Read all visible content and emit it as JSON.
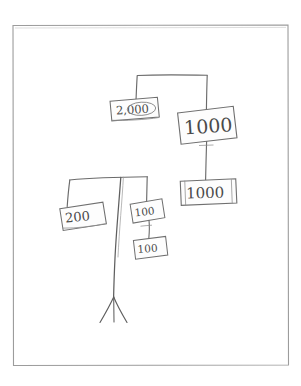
{
  "image": {
    "kind": "scanned-hand-drawn-diagram",
    "title": "Hand-drawn banknote denomination tree",
    "background_color": "#ffffff",
    "ink_color": "#5a5a5a",
    "frame": {
      "name": "page-border",
      "color": "#9a9a9a",
      "x": 12,
      "y": 25,
      "width": 276,
      "height": 340
    }
  },
  "nodes": [
    {
      "id": "note-2000",
      "label": "2,000",
      "semantic": "banknote-label-2000",
      "x": 110,
      "y": 99,
      "width": 48,
      "height": 20,
      "rotation": -3,
      "font_size": 11,
      "circled_part": "000"
    },
    {
      "id": "note-1000-upper",
      "label": "1000",
      "semantic": "banknote-label-1000-upper",
      "x": 178,
      "y": 109,
      "width": 56,
      "height": 32,
      "rotation": -4,
      "font_size": 17
    },
    {
      "id": "note-1000-lower",
      "label": "1000",
      "semantic": "banknote-label-1000-lower",
      "x": 180,
      "y": 180,
      "width": 56,
      "height": 24,
      "rotation": -1,
      "font_size": 14
    },
    {
      "id": "note-200",
      "label": "200",
      "semantic": "banknote-label-200",
      "x": 60,
      "y": 205,
      "width": 44,
      "height": 22,
      "rotation": -5,
      "font_size": 12
    },
    {
      "id": "note-100-upper",
      "label": "100",
      "semantic": "banknote-label-100-upper",
      "x": 131,
      "y": 201,
      "width": 32,
      "height": 20,
      "rotation": -6,
      "font_size": 10
    },
    {
      "id": "note-100-lower",
      "label": "100",
      "semantic": "banknote-label-100-lower",
      "x": 134,
      "y": 238,
      "width": 32,
      "height": 20,
      "rotation": -4,
      "font_size": 10
    }
  ],
  "connectors": [
    {
      "id": "top-crossbar",
      "semantic": "connector-top-crossbar",
      "from": "bracket-left-top",
      "to": "bracket-right-top"
    },
    {
      "id": "top-left-drop",
      "semantic": "connector-to-note-2000",
      "from": "top-crossbar",
      "to": "note-2000"
    },
    {
      "id": "top-right-drop",
      "semantic": "connector-to-note-1000-upper",
      "from": "top-crossbar",
      "to": "note-1000-upper"
    },
    {
      "id": "mid-right-drop",
      "semantic": "connector-to-note-1000-lower",
      "from": "note-1000-upper",
      "to": "note-1000-lower"
    },
    {
      "id": "lower-crossbar",
      "semantic": "connector-lower-crossbar",
      "from": "bracket-left-low",
      "to": "bracket-right-low"
    },
    {
      "id": "lower-left-drop",
      "semantic": "connector-to-note-200",
      "from": "lower-crossbar",
      "to": "note-200"
    },
    {
      "id": "lower-right-drop",
      "semantic": "connector-to-note-100-upper",
      "from": "lower-crossbar",
      "to": "note-100-upper"
    },
    {
      "id": "hundred-link",
      "semantic": "connector-to-note-100-lower",
      "from": "note-100-upper",
      "to": "note-100-lower"
    },
    {
      "id": "center-stem",
      "semantic": "connector-center-stem",
      "from": "lower-crossbar",
      "to": "tripod-foot"
    },
    {
      "id": "tripod-foot",
      "semantic": "tripod-foot-legs",
      "from": "center-stem",
      "to": "page-bottom"
    }
  ],
  "labels_in_reading_order": [
    "2,000",
    "1000",
    "1000",
    "200",
    "100",
    "100"
  ]
}
